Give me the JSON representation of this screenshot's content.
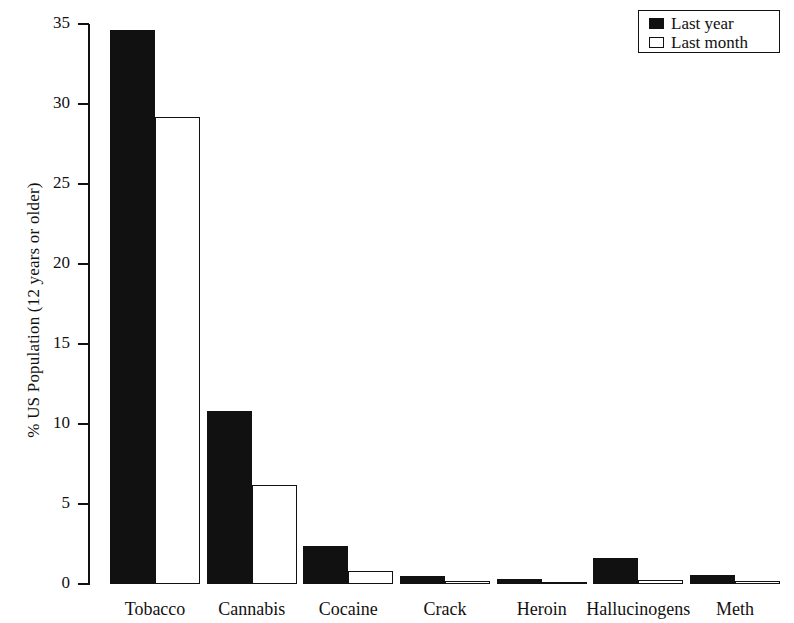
{
  "chart_data": {
    "type": "bar",
    "title": "",
    "subtitle": "",
    "xlabel": "",
    "ylabel": "% US Population (12 years or older)",
    "ylim": [
      0,
      35
    ],
    "yticks": [
      0,
      5,
      10,
      15,
      20,
      25,
      30,
      35
    ],
    "ytick_labels": [
      "0",
      "5",
      "10",
      "15",
      "20",
      "25",
      "30",
      "35"
    ],
    "grid": false,
    "legend_position": "top-right",
    "categories": [
      "Tobacco",
      "Cannabis",
      "Cocaine",
      "Crack",
      "Heroin",
      "Hallucinogens",
      "Meth"
    ],
    "series": [
      {
        "name": "Last year",
        "color": "#111111",
        "style": "filled",
        "values": [
          34.6,
          10.8,
          2.4,
          0.5,
          0.3,
          1.6,
          0.55
        ]
      },
      {
        "name": "Last month",
        "color": "#ffffff",
        "style": "outline",
        "values": [
          29.2,
          6.2,
          0.8,
          0.2,
          0.15,
          0.25,
          0.2
        ]
      }
    ]
  },
  "legend": {
    "items": [
      {
        "label": "Last year",
        "swatch": "filled-square-icon"
      },
      {
        "label": "Last month",
        "swatch": "outline-square-icon"
      }
    ]
  },
  "axes": {
    "y_title": "% US Population (12 years or older)"
  }
}
